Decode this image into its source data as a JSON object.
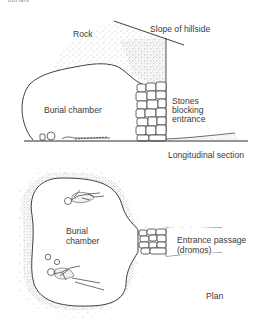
{
  "figure": {
    "top_cutoff_text": "burials",
    "section": {
      "title": "Longitudinal section",
      "labels": {
        "rock": "Rock",
        "slope": "Slope of hillside",
        "chamber": "Burial chamber",
        "stones_line1": "Stones",
        "stones_line2": "blocking",
        "stones_line3": "entrance"
      }
    },
    "plan": {
      "title": "Plan",
      "labels": {
        "chamber_line1": "Burial",
        "chamber_line2": "chamber",
        "passage_line1": "Entrance passage",
        "passage_line2": "(dromos)"
      }
    },
    "colors": {
      "ink": "#2a2a2a",
      "stipple": "#6a6a6a",
      "text": "#3a3a3a"
    }
  }
}
